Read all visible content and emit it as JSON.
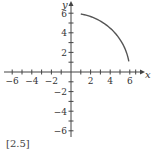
{
  "chart_data": {
    "type": "line",
    "title": "",
    "xlabel": "x",
    "ylabel": "y",
    "xlim": [
      -6.5,
      7
    ],
    "ylim": [
      -6.5,
      7
    ],
    "grid": false,
    "x_ticks": [
      -6,
      -4,
      -2,
      2,
      4,
      6
    ],
    "y_ticks": [
      -6,
      -4,
      -2,
      2,
      4,
      6
    ],
    "x_tick_labels": [
      "−6",
      "−4",
      "−2",
      "2",
      "4",
      "6"
    ],
    "y_tick_labels": [
      "−6",
      "−4",
      "−2",
      "2",
      "4",
      "6"
    ],
    "series": [
      {
        "name": "curve",
        "description": "arc of circle radius 6 in first quadrant",
        "x": [
          1.0,
          2.0,
          3.0,
          4.0,
          4.5,
          5.0,
          5.5,
          5.9
        ],
        "y": [
          5.92,
          5.66,
          5.2,
          4.47,
          3.97,
          3.32,
          2.4,
          1.1
        ]
      }
    ]
  },
  "caption": "[2.5]"
}
